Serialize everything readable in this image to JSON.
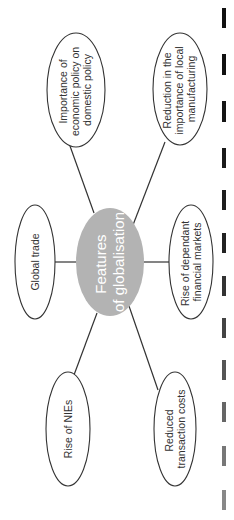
{
  "diagram": {
    "title": "Features of globalisation",
    "center": {
      "lines": [
        "Features",
        "of globalisation"
      ],
      "fill": "#b3b3b3",
      "text_color": "#ffffff"
    },
    "nodes": [
      {
        "id": "economic-policy",
        "lines": [
          "Importance of",
          "economic policy on",
          "domestic policy"
        ]
      },
      {
        "id": "local-manufacturing",
        "lines": [
          "Reduction in the",
          "importance of local",
          "manufacturing"
        ]
      },
      {
        "id": "global-trade",
        "lines": [
          "Global trade"
        ]
      },
      {
        "id": "financial-markets",
        "lines": [
          "Rise of dependant",
          "financial markets"
        ]
      },
      {
        "id": "nies",
        "lines": [
          "Rise of NIEs"
        ]
      },
      {
        "id": "transaction-costs",
        "lines": [
          "Reduced",
          "transaction costs"
        ]
      }
    ],
    "orientation": "rotated 90° counter-clockwise",
    "colors": {
      "stroke": "#333333",
      "node_fill": "#ffffff",
      "center_fill": "#b3b3b3"
    }
  }
}
